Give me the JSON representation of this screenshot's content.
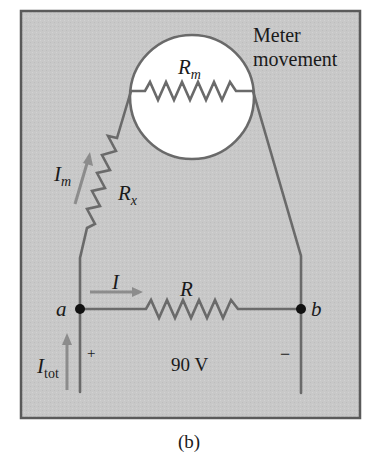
{
  "figure": {
    "caption": "(b)",
    "background_color": "#c9c9c9",
    "border_color": "#5a5a5a",
    "wire_color": "#6a6a6a",
    "arrow_color": "#8c8c8c"
  },
  "meter": {
    "label_line1": "Meter",
    "label_line2": "movement",
    "resistor_symbol": "R",
    "resistor_subscript": "m"
  },
  "series_resistor": {
    "symbol": "R",
    "subscript": "x",
    "current_symbol": "I",
    "current_subscript": "m"
  },
  "shunt_resistor": {
    "symbol": "R",
    "current_symbol": "I"
  },
  "nodes": {
    "a": "a",
    "b": "b"
  },
  "source": {
    "total_current_symbol": "I",
    "total_current_subscript": "tot",
    "plus_sign": "+",
    "minus_sign": "−",
    "voltage": "90 V"
  }
}
